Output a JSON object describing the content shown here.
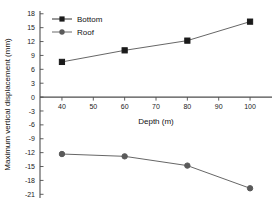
{
  "chart_data": {
    "type": "line",
    "title": "",
    "xlabel": "Depth (m)",
    "ylabel": "Maximum vertical displacement (mm)",
    "x": [
      40,
      60,
      80,
      100
    ],
    "xlim": [
      33,
      107
    ],
    "ylim": [
      -21.8,
      18.6
    ],
    "xticks": [
      40,
      50,
      60,
      70,
      80,
      90,
      100
    ],
    "xtick_labels": [
      "40",
      "50",
      "60",
      "70",
      "80",
      "90",
      "100"
    ],
    "yticks": [
      18,
      15,
      12,
      9,
      6,
      3,
      0,
      -3,
      -6,
      -9,
      -12,
      -15,
      -18,
      -21
    ],
    "ytick_labels": [
      "18",
      "15",
      "12",
      "9",
      "6",
      "3",
      "0",
      "-3",
      "-6",
      "-9",
      "-12",
      "-15",
      "-18",
      "-21"
    ],
    "grid": false,
    "legend_position": "upper-left",
    "series": [
      {
        "name": "Bottom",
        "marker": "square",
        "color": "#1a1a1a",
        "values": [
          7.6,
          10.1,
          12.2,
          16.3
        ]
      },
      {
        "name": "Roof",
        "marker": "circle",
        "color": "#5a5a5a",
        "values": [
          -12.3,
          -12.8,
          -14.8,
          -19.7
        ]
      }
    ]
  },
  "legend": {
    "items": [
      {
        "label": "Bottom",
        "marker": "square-marker"
      },
      {
        "label": "Roof",
        "marker": "circle-marker"
      }
    ]
  },
  "axes": {
    "x_title": "Depth (m)",
    "y_title": "Maximum vertical displacement (mm)"
  }
}
